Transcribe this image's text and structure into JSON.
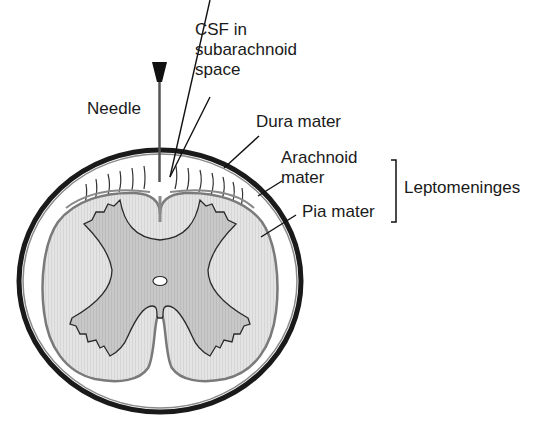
{
  "diagram": {
    "labels": {
      "csf_line1": "CSF in",
      "csf_line2": "subarachnoid",
      "csf_line3": "space",
      "needle": "Needle",
      "dura": "Dura mater",
      "arachnoid_line1": "Arachnoid",
      "arachnoid_line2": "mater",
      "pia": "Pia mater",
      "leptomeninges": "Leptomeninges"
    },
    "colors": {
      "dura": "#1a1a1a",
      "white_matter": "#e2e2e2",
      "gray_matter": "#c4c4c4",
      "pia_outline": "#7a7a7a",
      "text": "#1a1a1a"
    }
  }
}
